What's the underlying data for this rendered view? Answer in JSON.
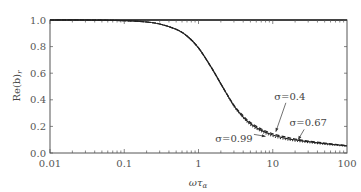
{
  "chart_data": {
    "type": "line",
    "title": "",
    "xlabel": "ωτ_α",
    "ylabel": "Re(b)_r",
    "xscale": "log",
    "xlim": [
      0.01,
      100
    ],
    "ylim": [
      0.0,
      1.0
    ],
    "grid": false,
    "x_ticks": [
      "0.01",
      "0.1",
      "1",
      "10",
      "100"
    ],
    "y_ticks": [
      "0.0",
      "0.2",
      "0.4",
      "0.6",
      "0.8",
      "1.0"
    ],
    "x": [
      0.01,
      0.03,
      0.1,
      0.2,
      0.3,
      0.5,
      0.7,
      1,
      1.5,
      2,
      3,
      4,
      5,
      7,
      10,
      15,
      20,
      30,
      50,
      70,
      100
    ],
    "series": [
      {
        "name": "σ=0.4",
        "style": "dashed",
        "values": [
          1.0,
          1.0,
          0.995,
          0.985,
          0.97,
          0.93,
          0.88,
          0.79,
          0.64,
          0.52,
          0.36,
          0.28,
          0.23,
          0.18,
          0.145,
          0.12,
          0.105,
          0.09,
          0.075,
          0.065,
          0.055
        ]
      },
      {
        "name": "σ=0.67",
        "style": "solid",
        "values": [
          1.0,
          1.0,
          0.995,
          0.985,
          0.97,
          0.93,
          0.88,
          0.79,
          0.64,
          0.52,
          0.355,
          0.27,
          0.22,
          0.17,
          0.135,
          0.11,
          0.098,
          0.085,
          0.07,
          0.062,
          0.053
        ]
      },
      {
        "name": "σ=0.99",
        "style": "dotted",
        "values": [
          1.0,
          1.0,
          0.995,
          0.985,
          0.97,
          0.93,
          0.88,
          0.79,
          0.64,
          0.52,
          0.35,
          0.265,
          0.21,
          0.16,
          0.125,
          0.1,
          0.09,
          0.078,
          0.065,
          0.058,
          0.05
        ]
      }
    ],
    "annotations": [
      {
        "text": "σ=0.4",
        "x_label": 17,
        "y_label": 0.4,
        "arrow_to_x": 11,
        "arrow_to_y": 0.16
      },
      {
        "text": "σ=0.67",
        "x_label": 30,
        "y_label": 0.2,
        "arrow_to_x": 22,
        "arrow_to_y": 0.1
      },
      {
        "text": "σ=0.99",
        "x_label": 3,
        "y_label": 0.08,
        "arrow_to_x": 8,
        "arrow_to_y": 0.125
      }
    ],
    "legend": "none (inline annotations)"
  },
  "labels": {
    "xlabel_main": "ωτ",
    "xlabel_sub": "α",
    "ylabel_main": "Re(b)",
    "ylabel_sub": "r"
  }
}
